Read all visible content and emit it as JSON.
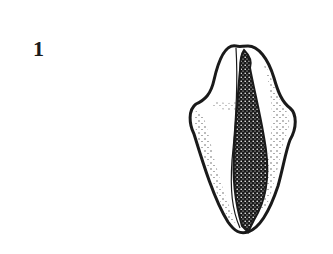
{
  "figure": {
    "label": "1",
    "colors": {
      "ink": "#1a1a1a",
      "background": "#ffffff"
    }
  }
}
